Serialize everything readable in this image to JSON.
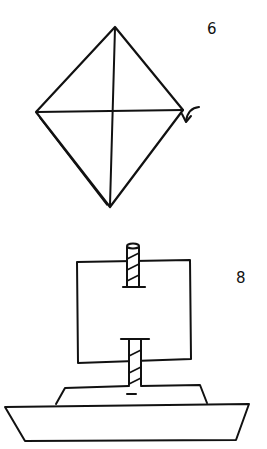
{
  "diagram": {
    "type": "origami-instructions",
    "colors": {
      "ink": "#111111",
      "background": "#ffffff"
    },
    "steps": [
      {
        "number": "6",
        "description": "Square rotated as a diamond with vertical and horizontal crease lines; arrow at right corner indicates folding the corner under/backward. Lower-left edge shows layered paper (double line).",
        "elements": [
          "diamond-outline",
          "vertical-crease",
          "horizontal-crease",
          "fold-arrow"
        ]
      },
      {
        "number": "8",
        "description": "Completed sailboat: square sail on a mast with striped mast sections above and below the sail, cabin on a trapezoid hull.",
        "elements": [
          "sail",
          "mast-top",
          "mast-bottom",
          "cabin",
          "hull"
        ]
      }
    ]
  }
}
